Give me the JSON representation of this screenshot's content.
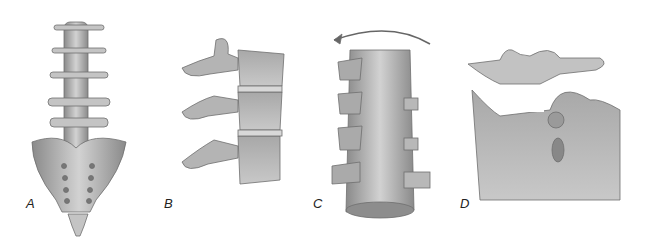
{
  "figure": {
    "panels": [
      {
        "id": "A",
        "label": "A",
        "description": "Posterior view of lumbar spine and sacrum"
      },
      {
        "id": "B",
        "label": "B",
        "description": "Lateral view of lumbar vertebrae with intervertebral discs"
      },
      {
        "id": "C",
        "label": "C",
        "description": "Rotated lumbar spine with rotation arrow"
      },
      {
        "id": "D",
        "label": "D",
        "description": "Close-up of vertebra with facet joint and surrounding tissue"
      }
    ]
  },
  "colors": {
    "bone": "#b9b9b9",
    "bone_light": "#d6d6d6",
    "bone_dark": "#7d7d7d",
    "background": "#ffffff"
  }
}
